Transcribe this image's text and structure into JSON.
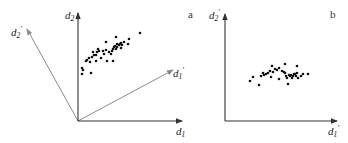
{
  "figure": {
    "panels": [
      {
        "id": "a",
        "panel_label": "a",
        "axes": {
          "x_label": "d",
          "x_sub": "1",
          "y_label": "d",
          "y_sub": "2"
        },
        "rotated_axes": {
          "x_label": "d",
          "x_sub": "1",
          "x_prime": "′",
          "y_label": "d",
          "y_sub": "2",
          "y_prime": "′"
        },
        "description": "Elongated point cloud correlated along a diagonal in original (d1, d2) axes, with rotated principal axes d1' and d2' drawn in grey"
      },
      {
        "id": "b",
        "panel_label": "b",
        "axes": {
          "x_label": "d",
          "x_sub": "1",
          "x_prime": "′",
          "y_label": "d",
          "y_sub": "2",
          "y_prime": "′"
        },
        "description": "Same point cloud re-plotted in rotated (d1', d2') axes, now aligned horizontally"
      }
    ],
    "colors": {
      "axis": "#333333",
      "rotated_axis": "#8a8a8a",
      "points": "#111111"
    },
    "points_a": [
      [
        82,
        68
      ],
      [
        82,
        74
      ],
      [
        83,
        70
      ],
      [
        91,
        73
      ],
      [
        86,
        61
      ],
      [
        87,
        60
      ],
      [
        89,
        58
      ],
      [
        90,
        62
      ],
      [
        92,
        57
      ],
      [
        94,
        55
      ],
      [
        93,
        52
      ],
      [
        96,
        55
      ],
      [
        96,
        61
      ],
      [
        97,
        52
      ],
      [
        99,
        51
      ],
      [
        103,
        51
      ],
      [
        104,
        54
      ],
      [
        106,
        50
      ],
      [
        106,
        42
      ],
      [
        107,
        61
      ],
      [
        109,
        52
      ],
      [
        111,
        54
      ],
      [
        112,
        51
      ],
      [
        113,
        49
      ],
      [
        113,
        61
      ],
      [
        114,
        47
      ],
      [
        115,
        46
      ],
      [
        116,
        49
      ],
      [
        116,
        37
      ],
      [
        117,
        44
      ],
      [
        117,
        47
      ],
      [
        119,
        45
      ],
      [
        120,
        44
      ],
      [
        121,
        43
      ],
      [
        122,
        45
      ],
      [
        121,
        48
      ],
      [
        124,
        42
      ],
      [
        128,
        44
      ],
      [
        129,
        39
      ],
      [
        140,
        33
      ],
      [
        98,
        49
      ],
      [
        101,
        58
      ]
    ],
    "points_b": [
      [
        250,
        81
      ],
      [
        253,
        77
      ],
      [
        259,
        85
      ],
      [
        263,
        73
      ],
      [
        264,
        75
      ],
      [
        266,
        74
      ],
      [
        268,
        73
      ],
      [
        270,
        71
      ],
      [
        271,
        77
      ],
      [
        272,
        66
      ],
      [
        273,
        72
      ],
      [
        275,
        69
      ],
      [
        277,
        70
      ],
      [
        279,
        79
      ],
      [
        282,
        71
      ],
      [
        284,
        72
      ],
      [
        285,
        73
      ],
      [
        285,
        64
      ],
      [
        286,
        76
      ],
      [
        287,
        78
      ],
      [
        288,
        84
      ],
      [
        289,
        75
      ],
      [
        290,
        76
      ],
      [
        291,
        75
      ],
      [
        292,
        78
      ],
      [
        293,
        76
      ],
      [
        294,
        74
      ],
      [
        295,
        74
      ],
      [
        296,
        76
      ],
      [
        297,
        73
      ],
      [
        297,
        66
      ],
      [
        298,
        78
      ],
      [
        301,
        76
      ],
      [
        303,
        74
      ],
      [
        308,
        74
      ],
      [
        279,
        68
      ],
      [
        261,
        76
      ]
    ]
  }
}
